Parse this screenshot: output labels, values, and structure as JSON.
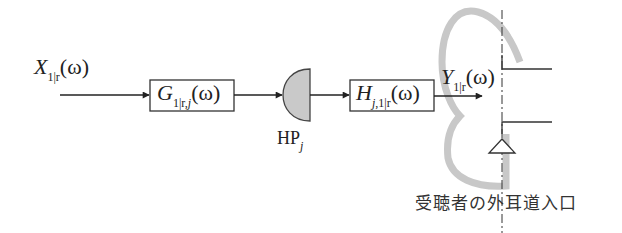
{
  "diagram": {
    "input_signal": {
      "symbol": "X",
      "subscript": "1|r",
      "argument": "(ω)",
      "arg_var": "ω"
    },
    "filter_g": {
      "symbol": "G",
      "subscript_main": "1|r,",
      "subscript_var": "j",
      "argument": "(ω)"
    },
    "headphone": {
      "symbol": "HP",
      "subscript": "j"
    },
    "filter_h": {
      "symbol": "H",
      "subscript_var": "j",
      "subscript_main": ",1|r",
      "argument": "(ω)"
    },
    "output_signal": {
      "symbol": "Y",
      "subscript": "1|r",
      "argument": "(ω)"
    },
    "ear_canal_label": "受聴者の外耳道入口"
  },
  "colors": {
    "line": "#222222",
    "ear_outline": "#c8c8c8",
    "headphone_fill": "#c9c9c9",
    "background": "#ffffff"
  }
}
